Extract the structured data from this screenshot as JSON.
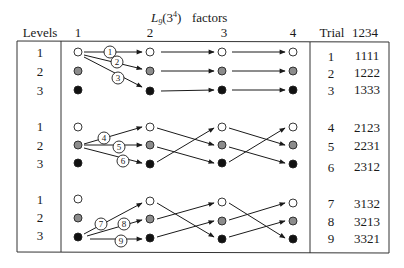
{
  "title": {
    "array_name": "L",
    "array_sub": "9",
    "array_arg": "(3",
    "array_sup": "4",
    "array_close": ")",
    "caption": "factors"
  },
  "headers": {
    "levels": "Levels",
    "factors": [
      "1",
      "2",
      "3",
      "4"
    ],
    "trial": "Trial",
    "code": "1234"
  },
  "levels": [
    "1",
    "2",
    "3"
  ],
  "level_colors": {
    "1": "#ffffff",
    "2": "#8c8c8c",
    "3": "#111111"
  },
  "groups": [
    {
      "trials": [
        {
          "trial": "1",
          "code": "1111",
          "marker": "1"
        },
        {
          "trial": "2",
          "code": "1222",
          "marker": "2"
        },
        {
          "trial": "3",
          "code": "1333",
          "marker": "3"
        }
      ]
    },
    {
      "trials": [
        {
          "trial": "4",
          "code": "2123",
          "marker": "4"
        },
        {
          "trial": "5",
          "code": "2231",
          "marker": "5"
        },
        {
          "trial": "6",
          "code": "2312",
          "marker": "6"
        }
      ]
    },
    {
      "trials": [
        {
          "trial": "7",
          "code": "3132",
          "marker": "7"
        },
        {
          "trial": "8",
          "code": "3213",
          "marker": "8"
        },
        {
          "trial": "9",
          "code": "3321",
          "marker": "9"
        }
      ]
    }
  ]
}
